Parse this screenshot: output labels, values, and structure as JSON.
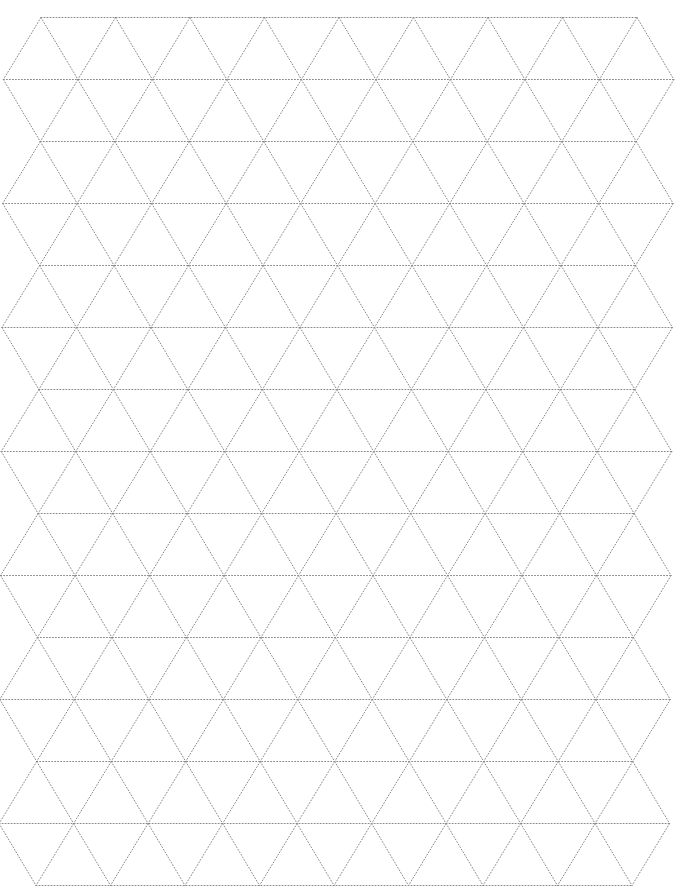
{
  "page": {
    "background": "#ffffff"
  },
  "grid": {
    "type": "isometric-triangle",
    "line_style": "dotted",
    "line_color": "#8a8a8a",
    "line_width": 1,
    "dash": "1 2",
    "rows": 15,
    "row_top_y": 17.5,
    "row_spacing": 62,
    "col_spacing": 74.5,
    "even_row_vertex_count": 9,
    "odd_row_vertex_count": 10,
    "even_row_start_x_top": 41,
    "even_row_start_x_bottom": 36,
    "odd_row_offset": -37.25
  }
}
